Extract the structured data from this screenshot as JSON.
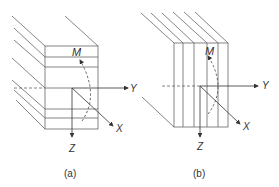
{
  "panels": [
    {
      "id": "a",
      "caption": "(a)",
      "labels": {
        "moment": "M",
        "y_axis": "Y",
        "x_axis": "X",
        "z_axis": "Z"
      },
      "description": "Laminate with horizontal layers; moment M about X axis"
    },
    {
      "id": "b",
      "caption": "(b)",
      "labels": {
        "moment": "M",
        "y_axis": "Y",
        "x_axis": "X",
        "z_axis": "Z"
      },
      "description": "Laminate with vertical layers; moment M about X axis"
    }
  ],
  "colors": {
    "line": "#555555",
    "text": "#333333",
    "background": "#ffffff"
  }
}
